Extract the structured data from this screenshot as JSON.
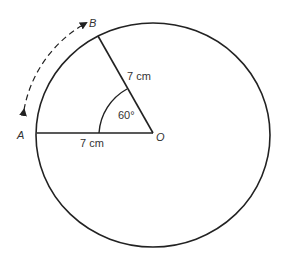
{
  "diagram": {
    "points": {
      "A": "A",
      "B": "B",
      "O": "O"
    },
    "radius_label_1": "7 cm",
    "radius_label_2": "7 cm",
    "angle_label": "60°",
    "arc_direction": "dashed double-headed arrow from A to B along circumference"
  }
}
